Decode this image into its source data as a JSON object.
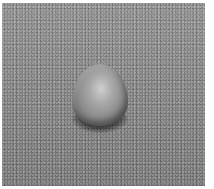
{
  "image": {
    "description": "Grayscale photograph of a small rounded pellet/granule resting on a textured gray surface",
    "colors": {
      "background_surface": "#8a8a8a",
      "object_highlight": "#cfcfcf",
      "object_base": "#8d8d8d",
      "shadow": "#1e1e1e",
      "border": "#ffffff"
    }
  }
}
